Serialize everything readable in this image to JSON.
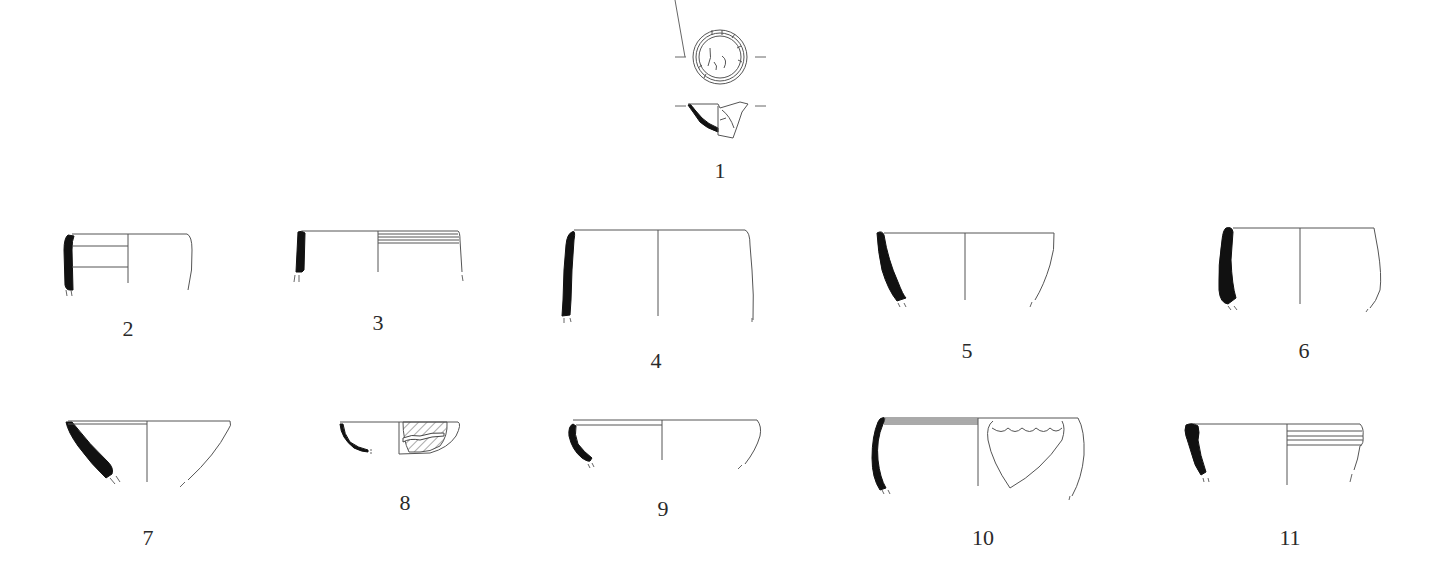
{
  "figure": {
    "type": "archaeological pottery profile plate",
    "items": [
      {
        "id": "1",
        "label": "1",
        "description": "small vessel base shown in plan view and profile section"
      },
      {
        "id": "2",
        "label": "2",
        "description": "straight-walled cup profile with two horizontal lines"
      },
      {
        "id": "3",
        "label": "3",
        "description": "straight-walled vessel with incised horizontal grooves below rim"
      },
      {
        "id": "4",
        "label": "4",
        "description": "deep straight-walled vessel profile"
      },
      {
        "id": "5",
        "label": "5",
        "description": "hemispherical bowl profile"
      },
      {
        "id": "6",
        "label": "6",
        "description": "bowl with thickened wall profile"
      },
      {
        "id": "7",
        "label": "7",
        "description": "conical bowl profile"
      },
      {
        "id": "8",
        "label": "8",
        "description": "shallow bowl with hatched painted band decoration"
      },
      {
        "id": "9",
        "label": "9",
        "description": "shallow rounded bowl profile"
      },
      {
        "id": "10",
        "label": "10",
        "description": "deep bowl with scalloped shield-shaped decoration"
      },
      {
        "id": "11",
        "label": "11",
        "description": "vessel with thickened rim and horizontal grooves"
      }
    ]
  },
  "colors": {
    "background": "#ffffff",
    "section_fill": "#111111",
    "line": "#555555",
    "label": "#2a2a2a"
  }
}
